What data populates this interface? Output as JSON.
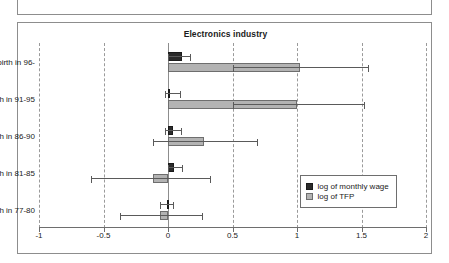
{
  "figure": {
    "title": "Electronics industry"
  },
  "chart_data": {
    "type": "bar",
    "orientation": "horizontal",
    "title": "Electronics industry",
    "xlabel": "",
    "ylabel": "",
    "xlim": [
      -1,
      2
    ],
    "xticks": [
      -1,
      -0.5,
      0,
      0.5,
      1,
      1.5,
      2
    ],
    "xticklabels": [
      "-1",
      "-0.5",
      "0",
      "0.5",
      "1",
      "1.5",
      "2"
    ],
    "grid": true,
    "grid_style": "dashed vertical",
    "legend_position": "bottom-right",
    "categories": [
      "Plant birth in 96-",
      "Plant birth in 91-95",
      "Plant birth in 86-90",
      "Plant birth in 81-85",
      "Plant birth in 77-80"
    ],
    "series": [
      {
        "name": "log of monthly wage",
        "color": "#2b2b2b",
        "values": [
          0.11,
          0.005,
          0.04,
          0.05,
          -0.01
        ],
        "error_low": [
          0.0,
          -0.02,
          -0.02,
          0.0,
          -0.06
        ],
        "error_high": [
          0.18,
          0.1,
          0.11,
          0.12,
          0.05
        ]
      },
      {
        "name": "log of TFP",
        "color": "#b3b3b3",
        "values": [
          1.02,
          1.0,
          0.28,
          -0.12,
          -0.06
        ],
        "error_low": [
          0.5,
          0.5,
          -0.12,
          -0.6,
          -0.37
        ],
        "error_high": [
          1.56,
          1.53,
          0.7,
          0.33,
          0.27
        ]
      }
    ]
  },
  "legend": {
    "items": [
      {
        "label": "log of monthly wage",
        "swatch": "wage"
      },
      {
        "label": "log of TFP",
        "swatch": "tfp"
      }
    ]
  }
}
